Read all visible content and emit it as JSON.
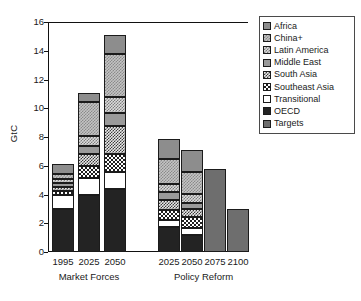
{
  "chart_data": {
    "type": "bar",
    "title": "",
    "subtitle": "",
    "xlabel": "",
    "ylabel": "GtC",
    "ylim": [
      0,
      16
    ],
    "yticks": [
      0,
      2,
      4,
      6,
      8,
      10,
      12,
      14,
      16
    ],
    "ytick_labels": [
      "0",
      "2",
      "4",
      "6",
      "8",
      "10",
      "12",
      "14",
      "16"
    ],
    "grid": false,
    "stacked": true,
    "legend_position": "top-right",
    "groups": [
      {
        "name": "Market Forces",
        "categories": [
          "1995",
          "2025",
          "2050"
        ]
      },
      {
        "name": "Policy Reform",
        "categories": [
          "2025",
          "2050",
          "2075",
          "2100"
        ]
      }
    ],
    "categories": [
      "1995",
      "2025",
      "2050",
      "2025",
      "2050",
      "2075",
      "2100"
    ],
    "series": [
      {
        "name": "OECD",
        "values": [
          3.0,
          4.0,
          4.4,
          1.75,
          1.15,
          0.0,
          0.0
        ]
      },
      {
        "name": "Transitional",
        "values": [
          1.0,
          1.15,
          1.2,
          0.5,
          0.55,
          0.0,
          0.0
        ]
      },
      {
        "name": "Southeast Asia",
        "values": [
          0.25,
          0.85,
          1.25,
          0.65,
          0.75,
          0.0,
          0.0
        ]
      },
      {
        "name": "South Asia",
        "values": [
          0.3,
          0.85,
          1.9,
          0.75,
          0.55,
          0.0,
          0.0
        ]
      },
      {
        "name": "Middle East",
        "values": [
          0.25,
          0.5,
          0.9,
          0.5,
          0.4,
          0.0,
          0.0
        ]
      },
      {
        "name": "Latin America",
        "values": [
          0.3,
          0.75,
          1.1,
          0.6,
          0.65,
          0.0,
          0.0
        ]
      },
      {
        "name": "China+",
        "values": [
          0.35,
          2.35,
          3.0,
          1.75,
          1.5,
          0.0,
          0.0
        ]
      },
      {
        "name": "Africa",
        "values": [
          0.65,
          0.6,
          1.35,
          1.35,
          1.55,
          0.0,
          0.0
        ]
      },
      {
        "name": "Targets",
        "values": [
          0.0,
          0.0,
          0.0,
          0.0,
          0.0,
          5.8,
          3.0
        ]
      }
    ],
    "totals": [
      6.1,
      11.05,
      15.1,
      7.85,
      7.1,
      5.8,
      3.0
    ]
  },
  "legend": {
    "items": [
      {
        "label": "Africa",
        "pattern": "p-africa"
      },
      {
        "label": "China+",
        "pattern": "p-china"
      },
      {
        "label": "Latin America",
        "pattern": "p-latin-america"
      },
      {
        "label": "Middle East",
        "pattern": "p-middle-east"
      },
      {
        "label": "South Asia",
        "pattern": "p-south-asia"
      },
      {
        "label": "Southeast Asia",
        "pattern": "p-southeast-asia"
      },
      {
        "label": "Transitional",
        "pattern": "p-transitional"
      },
      {
        "label": "OECD",
        "pattern": "p-oecd"
      },
      {
        "label": "Targets",
        "pattern": "p-targets"
      }
    ]
  },
  "colors": {
    "axis": "#111111",
    "text": "#1a1a1a",
    "background": "#ffffff",
    "oecd": "#232323",
    "transitional": "#ffffff",
    "middle_east": "#9a9a9a",
    "africa": "#8d8d8d",
    "targets": "#6e6e6e"
  }
}
